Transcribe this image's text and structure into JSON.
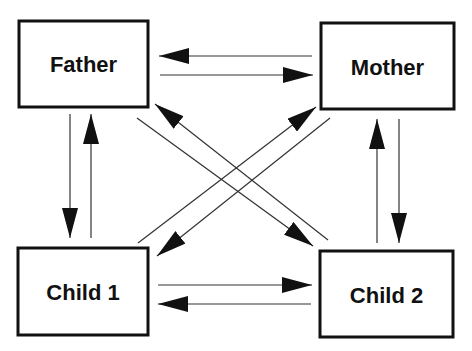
{
  "diagram": {
    "type": "family-interaction-diagram",
    "colors": {
      "line": "#1a1a1a",
      "box_border": "#111111",
      "text": "#111111",
      "background": "#ffffff"
    },
    "nodes": [
      {
        "id": "father",
        "label": "Father"
      },
      {
        "id": "mother",
        "label": "Mother"
      },
      {
        "id": "child1",
        "label": "Child 1"
      },
      {
        "id": "child2",
        "label": "Child 2"
      }
    ],
    "edges": [
      {
        "from": "Mother",
        "to": "Father"
      },
      {
        "from": "Father",
        "to": "Mother"
      },
      {
        "from": "Father",
        "to": "Child 1"
      },
      {
        "from": "Child 1",
        "to": "Father"
      },
      {
        "from": "Child 2",
        "to": "Mother"
      },
      {
        "from": "Mother",
        "to": "Child 2"
      },
      {
        "from": "Child 1",
        "to": "Child 2"
      },
      {
        "from": "Child 2",
        "to": "Child 1"
      },
      {
        "from": "Father",
        "to": "Child 2"
      },
      {
        "from": "Child 2",
        "to": "Father"
      },
      {
        "from": "Child 1",
        "to": "Mother"
      },
      {
        "from": "Mother",
        "to": "Child 1"
      }
    ]
  }
}
